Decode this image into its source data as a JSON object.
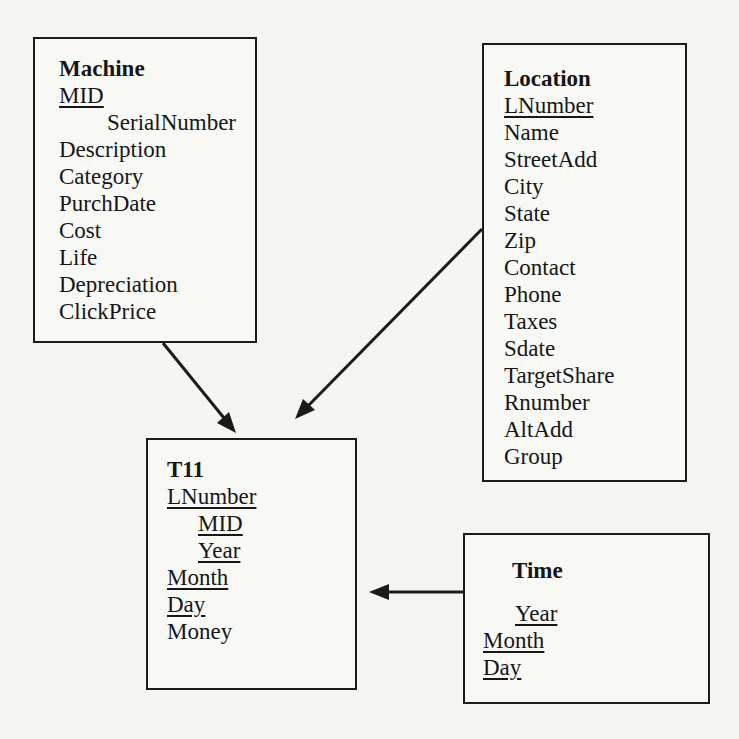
{
  "diagram": {
    "type": "entity-relationship-schema",
    "colors": {
      "background": "#f5f5f2",
      "box_fill": "#f8f8f5",
      "line": "#1b1b1b",
      "text": "#161616"
    },
    "entities": {
      "machine": {
        "title": "Machine",
        "attributes": [
          {
            "text": "MID",
            "underline": true,
            "indent": 0
          },
          {
            "text": "SerialNumber",
            "underline": false,
            "indent": 1
          },
          {
            "text": "Description",
            "underline": false,
            "indent": 0
          },
          {
            "text": "Category",
            "underline": false,
            "indent": 0
          },
          {
            "text": "PurchDate",
            "underline": false,
            "indent": 0
          },
          {
            "text": "Cost",
            "underline": false,
            "indent": 0
          },
          {
            "text": "Life",
            "underline": false,
            "indent": 0
          },
          {
            "text": "Depreciation",
            "underline": false,
            "indent": 0
          },
          {
            "text": "ClickPrice",
            "underline": false,
            "indent": 0
          }
        ]
      },
      "location": {
        "title": "Location",
        "attributes": [
          {
            "text": "LNumber",
            "underline": true,
            "indent": 0
          },
          {
            "text": "Name",
            "underline": false,
            "indent": 0
          },
          {
            "text": "StreetAdd",
            "underline": false,
            "indent": 0
          },
          {
            "text": "City",
            "underline": false,
            "indent": 0
          },
          {
            "text": "State",
            "underline": false,
            "indent": 0
          },
          {
            "text": "Zip",
            "underline": false,
            "indent": 0
          },
          {
            "text": "Contact",
            "underline": false,
            "indent": 0
          },
          {
            "text": "Phone",
            "underline": false,
            "indent": 0
          },
          {
            "text": "Taxes",
            "underline": false,
            "indent": 0
          },
          {
            "text": "Sdate",
            "underline": false,
            "indent": 0
          },
          {
            "text": "TargetShare",
            "underline": false,
            "indent": 0
          },
          {
            "text": "Rnumber",
            "underline": false,
            "indent": 0
          },
          {
            "text": "AltAdd",
            "underline": false,
            "indent": 0
          },
          {
            "text": "Group",
            "underline": false,
            "indent": 0
          }
        ]
      },
      "t11": {
        "title": "T11",
        "attributes": [
          {
            "text": "LNumber",
            "underline": true,
            "indent": 0
          },
          {
            "text": "MID",
            "underline": true,
            "indent": 1
          },
          {
            "text": "Year",
            "underline": true,
            "indent": 1
          },
          {
            "text": "Month",
            "underline": true,
            "indent": 0
          },
          {
            "text": "Day",
            "underline": true,
            "indent": 0
          },
          {
            "text": "Money",
            "underline": false,
            "indent": 0
          }
        ]
      },
      "time": {
        "title": "Time",
        "attributes": [
          {
            "text": "Year",
            "underline": true,
            "indent": 1
          },
          {
            "text": "Month",
            "underline": true,
            "indent": 0
          },
          {
            "text": "Day",
            "underline": true,
            "indent": 0
          }
        ]
      }
    },
    "relationships": [
      {
        "from": "Machine",
        "to": "T11"
      },
      {
        "from": "Location",
        "to": "T11"
      },
      {
        "from": "Time",
        "to": "T11"
      }
    ]
  }
}
